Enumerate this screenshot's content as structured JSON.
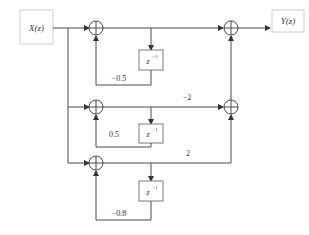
{
  "diagram": {
    "type": "signal-flow block diagram (parallel IIR realization)",
    "input": {
      "label": "X(z)"
    },
    "output": {
      "label": "Y(z)"
    },
    "branches": [
      {
        "id": "branch-1",
        "delay_label": "z",
        "delay_exp": "−1",
        "feedback_gain": "−0.5",
        "forward_gain": ""
      },
      {
        "id": "branch-2",
        "delay_label": "z",
        "delay_exp": "−1",
        "feedback_gain": "0.5",
        "forward_gain": "−2"
      },
      {
        "id": "branch-3",
        "delay_label": "z",
        "delay_exp": "−1",
        "feedback_gain": "−0.8",
        "forward_gain": "2"
      }
    ],
    "colors": {
      "line": "#4a4a4a",
      "box_border": "#7a7a7a",
      "io_border": "#cfcfcf",
      "background": "#ffffff"
    }
  }
}
